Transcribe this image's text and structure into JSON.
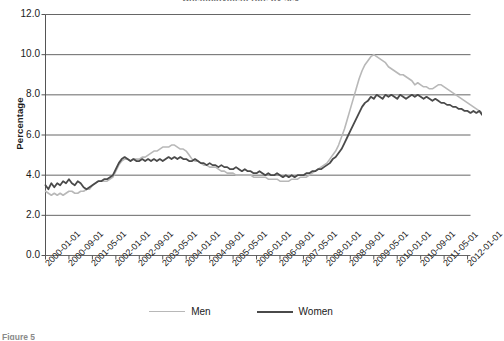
{
  "figure": {
    "cut_title": "Unemployment rate by sex",
    "caption": "Figure 5"
  },
  "legend": {
    "position": "bottom-center",
    "entries": [
      {
        "label": "Men",
        "color": "#b8b8b8"
      },
      {
        "label": "Women",
        "color": "#4a4a4a"
      }
    ]
  },
  "chart_data": {
    "type": "line",
    "title": "Unemployment rate by sex",
    "xlabel": "",
    "ylabel": "Percentage",
    "ylim": [
      0.0,
      12.0
    ],
    "yticks": [
      "0.0",
      "2.0",
      "4.0",
      "6.0",
      "8.0",
      "10.0",
      "12.0"
    ],
    "ytick_values": [
      0.0,
      2.0,
      4.0,
      6.0,
      8.0,
      10.0,
      12.0
    ],
    "grid": "horizontal",
    "x_tick_labels": [
      "2000-01-01",
      "2000-09-01",
      "2001-05-01",
      "2002-01-01",
      "2002-09-01",
      "2003-05-01",
      "2004-01-01",
      "2004-09-01",
      "2005-05-01",
      "2006-01-01",
      "2006-09-01",
      "2007-05-01",
      "2008-01-01",
      "2008-09-01",
      "2009-05-01",
      "2010-01-01",
      "2010-09-01",
      "2011-05-01",
      "2012-01-01"
    ],
    "x_tick_index": [
      0,
      8,
      16,
      24,
      32,
      40,
      48,
      56,
      64,
      72,
      80,
      88,
      96,
      104,
      112,
      120,
      128,
      136,
      144
    ],
    "n_points": 146,
    "x_start": "2000-01-01",
    "x_end": "2012-02-01",
    "x_step_months": 1,
    "series": [
      {
        "name": "Men",
        "color": "#b8b8b8",
        "width": 1.6,
        "values": [
          3.2,
          3.1,
          3.0,
          3.1,
          3.0,
          3.1,
          3.0,
          3.1,
          3.2,
          3.2,
          3.1,
          3.1,
          3.2,
          3.2,
          3.3,
          3.3,
          3.5,
          3.6,
          3.7,
          3.7,
          3.7,
          3.7,
          3.8,
          3.9,
          4.2,
          4.5,
          4.7,
          4.8,
          4.8,
          4.7,
          4.8,
          4.8,
          4.8,
          4.9,
          4.9,
          5.0,
          5.1,
          5.2,
          5.2,
          5.3,
          5.4,
          5.4,
          5.4,
          5.5,
          5.5,
          5.4,
          5.3,
          5.3,
          5.2,
          5.0,
          4.8,
          4.7,
          4.7,
          4.6,
          4.5,
          4.5,
          4.4,
          4.4,
          4.4,
          4.3,
          4.2,
          4.2,
          4.1,
          4.1,
          4.1,
          4.0,
          4.0,
          4.0,
          4.0,
          4.0,
          4.0,
          3.9,
          3.9,
          3.9,
          3.9,
          3.9,
          3.8,
          3.8,
          3.8,
          3.8,
          3.7,
          3.7,
          3.7,
          3.7,
          3.8,
          3.8,
          3.8,
          3.9,
          3.9,
          3.9,
          4.0,
          4.1,
          4.2,
          4.3,
          4.4,
          4.5,
          4.6,
          4.8,
          5.0,
          5.2,
          5.5,
          5.9,
          6.3,
          6.8,
          7.3,
          7.8,
          8.3,
          8.8,
          9.2,
          9.5,
          9.7,
          9.9,
          10.0,
          9.9,
          9.8,
          9.7,
          9.6,
          9.4,
          9.3,
          9.2,
          9.1,
          9.0,
          9.0,
          8.9,
          8.8,
          8.7,
          8.5,
          8.6,
          8.5,
          8.4,
          8.4,
          8.3,
          8.3,
          8.4,
          8.5,
          8.5,
          8.4,
          8.3,
          8.2,
          8.1,
          8.0,
          7.9,
          7.8,
          7.7,
          7.6,
          7.5,
          7.4,
          7.3,
          7.2,
          7.1
        ]
      },
      {
        "name": "Women",
        "color": "#4a4a4a",
        "width": 1.8,
        "values": [
          3.5,
          3.3,
          3.6,
          3.4,
          3.6,
          3.5,
          3.7,
          3.6,
          3.8,
          3.6,
          3.5,
          3.7,
          3.6,
          3.4,
          3.3,
          3.4,
          3.5,
          3.6,
          3.7,
          3.7,
          3.8,
          3.8,
          3.9,
          4.0,
          4.3,
          4.6,
          4.8,
          4.9,
          4.8,
          4.7,
          4.8,
          4.7,
          4.7,
          4.8,
          4.7,
          4.8,
          4.7,
          4.8,
          4.7,
          4.8,
          4.7,
          4.8,
          4.9,
          4.8,
          4.9,
          4.8,
          4.9,
          4.8,
          4.8,
          4.7,
          4.7,
          4.8,
          4.7,
          4.6,
          4.6,
          4.5,
          4.6,
          4.5,
          4.5,
          4.4,
          4.5,
          4.4,
          4.4,
          4.3,
          4.3,
          4.4,
          4.3,
          4.2,
          4.3,
          4.2,
          4.2,
          4.1,
          4.1,
          4.2,
          4.1,
          4.0,
          4.1,
          4.0,
          4.0,
          4.1,
          4.0,
          3.9,
          4.0,
          3.9,
          4.0,
          3.9,
          4.0,
          4.0,
          4.0,
          4.1,
          4.1,
          4.2,
          4.2,
          4.3,
          4.3,
          4.4,
          4.5,
          4.6,
          4.8,
          4.9,
          5.1,
          5.3,
          5.6,
          5.9,
          6.2,
          6.5,
          6.8,
          7.1,
          7.4,
          7.6,
          7.7,
          7.9,
          7.8,
          8.0,
          7.9,
          7.8,
          8.0,
          7.9,
          8.0,
          7.9,
          7.8,
          8.0,
          7.9,
          7.8,
          7.9,
          8.0,
          7.9,
          8.0,
          7.9,
          7.8,
          7.9,
          7.8,
          7.7,
          7.8,
          7.7,
          7.6,
          7.6,
          7.5,
          7.5,
          7.4,
          7.4,
          7.3,
          7.3,
          7.2,
          7.2,
          7.1,
          7.2,
          7.1,
          7.2,
          7.0
        ]
      }
    ]
  }
}
